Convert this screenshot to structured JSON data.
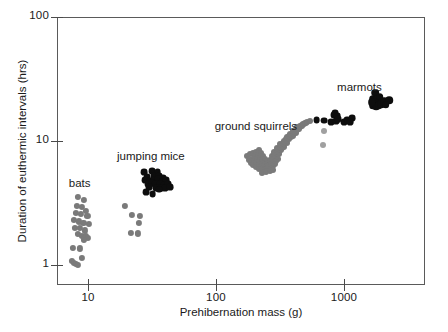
{
  "chart_data": {
    "type": "scatter",
    "title": "",
    "xlabel": "Prehibernation mass (g)",
    "ylabel": "Duration of euthermic intervals (hrs)",
    "xscale": "log",
    "yscale": "log",
    "xlim": [
      6,
      4000
    ],
    "ylim": [
      0.8,
      100
    ],
    "xticks": [
      10,
      100,
      1000
    ],
    "xtick_labels": [
      "10",
      "100",
      "1000"
    ],
    "yticks": [
      1,
      10,
      100
    ],
    "ytick_labels": [
      "1",
      "10",
      "100"
    ],
    "grid": false,
    "legend": "none",
    "annotations": [
      {
        "text": "bats",
        "x": 8.6,
        "y": 4.6
      },
      {
        "text": "jumping mice",
        "x": 31,
        "y": 7.6
      },
      {
        "text": "ground squirrels",
        "x": 205,
        "y": 13.2
      },
      {
        "text": "marmots",
        "x": 1320,
        "y": 27.5
      }
    ],
    "colors": {
      "gray": "#7a7a7a",
      "black": "#0d0d0d",
      "axis": "#5a5a5a"
    },
    "series": [
      {
        "name": "bats",
        "color": "#7a7a7a",
        "marker": "circle",
        "points": [
          [
            8.4,
            3.55
          ],
          [
            9.3,
            3.35
          ],
          [
            8.2,
            3.0
          ],
          [
            9.0,
            2.95
          ],
          [
            9.6,
            2.75
          ],
          [
            8.0,
            2.62
          ],
          [
            8.8,
            2.6
          ],
          [
            9.9,
            2.5
          ],
          [
            7.8,
            2.3
          ],
          [
            8.5,
            2.25
          ],
          [
            9.2,
            2.18
          ],
          [
            10.1,
            2.15
          ],
          [
            7.9,
            2.0
          ],
          [
            8.7,
            1.98
          ],
          [
            9.4,
            1.9
          ],
          [
            8.3,
            1.78
          ],
          [
            9.0,
            1.72
          ],
          [
            9.6,
            1.7
          ],
          [
            10.0,
            1.66
          ],
          [
            9.3,
            1.6
          ],
          [
            7.6,
            1.38
          ],
          [
            8.6,
            1.36
          ],
          [
            7.5,
            1.08
          ],
          [
            7.8,
            1.04
          ],
          [
            8.1,
            1.02
          ],
          [
            8.4,
            1.0
          ],
          [
            8.9,
            1.14
          ]
        ]
      },
      {
        "name": "jumping mice gray",
        "color": "#7a7a7a",
        "marker": "circle",
        "points": [
          [
            22.0,
            2.52
          ],
          [
            25.5,
            2.5
          ],
          [
            25.0,
            2.2
          ],
          [
            21.5,
            1.82
          ],
          [
            24.5,
            1.8
          ],
          [
            19.5,
            3.0
          ]
        ]
      },
      {
        "name": "jumping mice",
        "color": "#0d0d0d",
        "marker": "circle",
        "points": [
          [
            27.5,
            5.6
          ],
          [
            31.5,
            5.75
          ],
          [
            35.0,
            5.6
          ],
          [
            29.0,
            5.1
          ],
          [
            32.5,
            5.2
          ],
          [
            36.0,
            5.2
          ],
          [
            38.5,
            5.0
          ],
          [
            28.0,
            4.85
          ],
          [
            30.5,
            4.8
          ],
          [
            33.0,
            4.85
          ],
          [
            35.5,
            4.9
          ],
          [
            38.0,
            4.7
          ],
          [
            41.0,
            4.85
          ],
          [
            29.5,
            4.5
          ],
          [
            31.5,
            4.55
          ],
          [
            33.5,
            4.5
          ],
          [
            36.5,
            4.5
          ],
          [
            39.5,
            4.4
          ],
          [
            42.5,
            4.5
          ],
          [
            30.0,
            4.25
          ],
          [
            34.0,
            4.2
          ],
          [
            37.0,
            4.15
          ],
          [
            40.0,
            4.2
          ],
          [
            28.5,
            3.9
          ],
          [
            32.0,
            3.75
          ],
          [
            36.0,
            4.05
          ],
          [
            43.5,
            4.25
          ]
        ]
      },
      {
        "name": "ground squirrels",
        "color": "#7a7a7a",
        "marker": "circle",
        "points": [
          [
            175,
            7.5
          ],
          [
            185,
            7.8
          ],
          [
            195,
            8.0
          ],
          [
            205,
            8.2
          ],
          [
            215,
            8.4
          ],
          [
            180,
            7.0
          ],
          [
            190,
            7.2
          ],
          [
            200,
            7.5
          ],
          [
            212,
            7.7
          ],
          [
            225,
            8.0
          ],
          [
            188,
            6.7
          ],
          [
            198,
            6.9
          ],
          [
            208,
            7.1
          ],
          [
            220,
            7.3
          ],
          [
            232,
            7.6
          ],
          [
            196,
            6.4
          ],
          [
            206,
            6.6
          ],
          [
            218,
            6.8
          ],
          [
            230,
            7.0
          ],
          [
            242,
            7.2
          ],
          [
            205,
            6.2
          ],
          [
            216,
            6.35
          ],
          [
            228,
            6.5
          ],
          [
            240,
            6.7
          ],
          [
            252,
            6.9
          ],
          [
            215,
            6.0
          ],
          [
            226,
            6.15
          ],
          [
            238,
            6.3
          ],
          [
            250,
            6.5
          ],
          [
            262,
            6.7
          ],
          [
            228,
            5.9
          ],
          [
            240,
            6.0
          ],
          [
            252,
            6.2
          ],
          [
            264,
            6.4
          ],
          [
            276,
            6.6
          ],
          [
            240,
            5.8
          ],
          [
            252,
            5.95
          ],
          [
            264,
            6.1
          ],
          [
            278,
            6.3
          ],
          [
            290,
            6.5
          ],
          [
            255,
            6.3
          ],
          [
            268,
            6.5
          ],
          [
            280,
            6.7
          ],
          [
            292,
            6.9
          ],
          [
            305,
            7.1
          ],
          [
            262,
            7.0
          ],
          [
            275,
            7.2
          ],
          [
            288,
            7.4
          ],
          [
            300,
            7.6
          ],
          [
            312,
            7.8
          ],
          [
            272,
            7.6
          ],
          [
            285,
            7.8
          ],
          [
            298,
            8.0
          ],
          [
            310,
            8.2
          ],
          [
            322,
            8.4
          ],
          [
            285,
            8.2
          ],
          [
            298,
            8.4
          ],
          [
            312,
            8.6
          ],
          [
            325,
            8.8
          ],
          [
            338,
            9.0
          ],
          [
            300,
            8.8
          ],
          [
            315,
            9.0
          ],
          [
            328,
            9.2
          ],
          [
            342,
            9.5
          ],
          [
            356,
            9.7
          ],
          [
            318,
            9.4
          ],
          [
            332,
            9.6
          ],
          [
            346,
            9.9
          ],
          [
            360,
            10.1
          ],
          [
            374,
            10.3
          ],
          [
            338,
            10.0
          ],
          [
            352,
            10.3
          ],
          [
            368,
            10.5
          ],
          [
            382,
            10.8
          ],
          [
            396,
            11.0
          ],
          [
            358,
            10.7
          ],
          [
            374,
            11.0
          ],
          [
            390,
            11.2
          ],
          [
            405,
            11.5
          ],
          [
            420,
            11.7
          ],
          [
            380,
            11.4
          ],
          [
            396,
            11.7
          ],
          [
            412,
            11.9
          ],
          [
            428,
            12.2
          ],
          [
            444,
            12.4
          ],
          [
            400,
            12.1
          ],
          [
            418,
            12.4
          ],
          [
            435,
            12.6
          ],
          [
            452,
            12.9
          ],
          [
            470,
            13.1
          ],
          [
            430,
            12.9
          ],
          [
            450,
            13.2
          ],
          [
            468,
            13.4
          ],
          [
            486,
            13.7
          ],
          [
            505,
            13.9
          ],
          [
            478,
            13.6
          ],
          [
            498,
            13.9
          ],
          [
            518,
            14.1
          ],
          [
            540,
            14.4
          ],
          [
            228,
            5.55
          ],
          [
            245,
            5.65
          ],
          [
            262,
            5.75
          ],
          [
            280,
            5.85
          ]
        ]
      },
      {
        "name": "transition dark",
        "color": "#0d0d0d",
        "marker": "circle",
        "points": [
          [
            610,
            14.8
          ],
          [
            700,
            14.6
          ],
          [
            790,
            14.2
          ],
          [
            830,
            16.2
          ],
          [
            855,
            16.8
          ],
          [
            880,
            16.0
          ],
          [
            870,
            14.4
          ],
          [
            905,
            15.0
          ],
          [
            1000,
            14.3
          ],
          [
            1050,
            14.9
          ],
          [
            1080,
            14.6
          ],
          [
            1150,
            15.4
          ],
          [
            1120,
            14.2
          ]
        ]
      },
      {
        "name": "marmots",
        "color": "#0d0d0d",
        "marker": "circle",
        "points": [
          [
            1680,
            22.0
          ],
          [
            1760,
            24.5
          ],
          [
            1820,
            21.8
          ],
          [
            1900,
            22.5
          ],
          [
            1750,
            20.6
          ],
          [
            1830,
            20.4
          ],
          [
            1900,
            20.2
          ],
          [
            1980,
            20.8
          ],
          [
            1700,
            19.2
          ],
          [
            1790,
            19.0
          ],
          [
            1870,
            19.5
          ],
          [
            1950,
            19.8
          ],
          [
            2060,
            21.0
          ],
          [
            2250,
            21.4
          ],
          [
            1640,
            20.5
          ],
          [
            2120,
            19.6
          ]
        ]
      },
      {
        "name": "low gray outliers",
        "color": "#a0a0a0",
        "marker": "circle",
        "points": [
          [
            700,
            12.0
          ],
          [
            680,
            9.3
          ]
        ]
      }
    ]
  },
  "marker_sizes": {
    "default": 6.4,
    "bats": 6.2,
    "jumping_mice": 6.8,
    "ground_squirrels": 6.0,
    "marmots": 7.6,
    "transition": 6.8
  }
}
